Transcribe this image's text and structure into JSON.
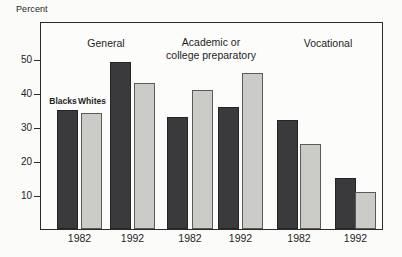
{
  "chart_data": {
    "type": "bar",
    "title": "",
    "ylabel": "Percent",
    "xlabel": "",
    "ylim": [
      0,
      61
    ],
    "yticks": [
      10,
      20,
      30,
      40,
      50
    ],
    "grid": false,
    "legend_position": "above-first-pair",
    "series": [
      {
        "name": "Blacks",
        "color": "#3a3a3c"
      },
      {
        "name": "Whites",
        "color": "#cbcbc8"
      }
    ],
    "groups": [
      {
        "label": "General",
        "pairs": [
          {
            "year": "1982",
            "values": [
              35,
              34
            ]
          },
          {
            "year": "1992",
            "values": [
              49,
              43
            ]
          }
        ]
      },
      {
        "label": "Academic or college preparatory",
        "label_lines": [
          "Academic or",
          "college preparatory"
        ],
        "pairs": [
          {
            "year": "1982",
            "values": [
              33,
              41
            ]
          },
          {
            "year": "1992",
            "values": [
              36,
              46
            ]
          }
        ]
      },
      {
        "label": "Vocational",
        "pairs": [
          {
            "year": "1982",
            "values": [
              32,
              25
            ]
          },
          {
            "year": "1992",
            "values": [
              15,
              11
            ]
          }
        ]
      }
    ]
  }
}
